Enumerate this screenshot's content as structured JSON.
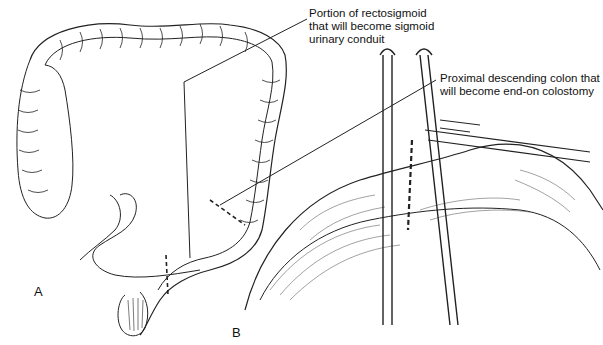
{
  "annotations": {
    "rectosigmoid": [
      "Portion of rectosigmoid",
      "that will become sigmoid",
      "urinary conduit"
    ],
    "descending": [
      "Proximal descending colon that",
      "will become end-on colostomy"
    ]
  },
  "panels": {
    "a": "A",
    "b": "B"
  }
}
